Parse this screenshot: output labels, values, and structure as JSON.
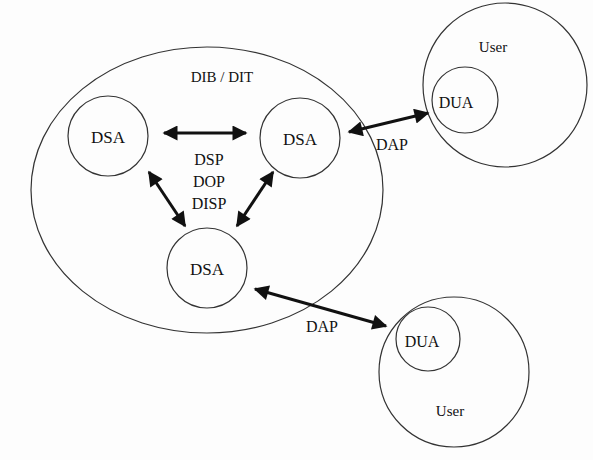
{
  "diagram": {
    "colors": {
      "stroke": "#333333",
      "arrow": "#111111",
      "text": "#111111",
      "background": "#fdfdfd"
    },
    "directory": {
      "label": "DIB / DIT"
    },
    "dsa_nodes": [
      {
        "id": "dsa-left",
        "label": "DSA"
      },
      {
        "id": "dsa-right",
        "label": "DSA"
      },
      {
        "id": "dsa-bottom",
        "label": "DSA"
      }
    ],
    "internal_protocols": [
      "DSP",
      "DOP",
      "DISP"
    ],
    "users": [
      {
        "id": "user-top",
        "label": "User",
        "agent": "DUA",
        "protocol": "DAP"
      },
      {
        "id": "user-bottom",
        "label": "User",
        "agent": "DUA",
        "protocol": "DAP"
      }
    ]
  }
}
